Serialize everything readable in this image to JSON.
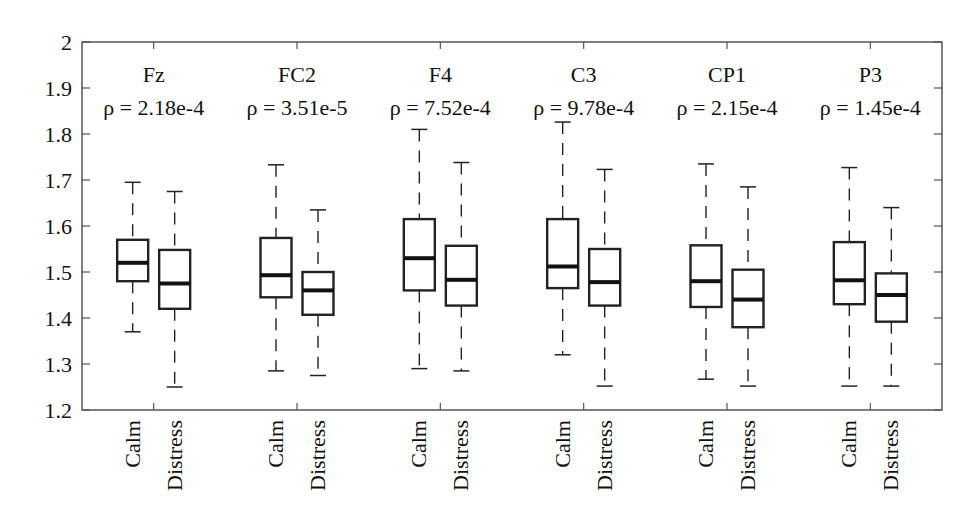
{
  "chart_data": {
    "type": "boxplot",
    "title": "",
    "xlabel": "",
    "ylabel": "",
    "ylim": [
      1.2,
      2.0
    ],
    "yticks": [
      "1.2",
      "1.3",
      "1.4",
      "1.5",
      "1.6",
      "1.7",
      "1.8",
      "1.9",
      "2"
    ],
    "grid": false,
    "legend": null,
    "conditions": [
      "Calm",
      "Distress"
    ],
    "groups": [
      {
        "channel": "Fz",
        "p_label": "ρ = 2.18e-4",
        "boxes": [
          {
            "condition": "Calm",
            "whisker_low": 1.37,
            "q1": 1.48,
            "median": 1.52,
            "q3": 1.57,
            "whisker_high": 1.695
          },
          {
            "condition": "Distress",
            "whisker_low": 1.25,
            "q1": 1.42,
            "median": 1.475,
            "q3": 1.548,
            "whisker_high": 1.675
          }
        ]
      },
      {
        "channel": "FC2",
        "p_label": "ρ = 3.51e-5",
        "boxes": [
          {
            "condition": "Calm",
            "whisker_low": 1.285,
            "q1": 1.445,
            "median": 1.493,
            "q3": 1.574,
            "whisker_high": 1.733
          },
          {
            "condition": "Distress",
            "whisker_low": 1.275,
            "q1": 1.407,
            "median": 1.46,
            "q3": 1.5,
            "whisker_high": 1.635
          }
        ]
      },
      {
        "channel": "F4",
        "p_label": "ρ = 7.52e-4",
        "boxes": [
          {
            "condition": "Calm",
            "whisker_low": 1.29,
            "q1": 1.46,
            "median": 1.53,
            "q3": 1.615,
            "whisker_high": 1.81
          },
          {
            "condition": "Distress",
            "whisker_low": 1.285,
            "q1": 1.427,
            "median": 1.483,
            "q3": 1.557,
            "whisker_high": 1.738
          }
        ]
      },
      {
        "channel": "C3",
        "p_label": "ρ = 9.78e-4",
        "boxes": [
          {
            "condition": "Calm",
            "whisker_low": 1.32,
            "q1": 1.465,
            "median": 1.512,
            "q3": 1.615,
            "whisker_high": 1.826
          },
          {
            "condition": "Distress",
            "whisker_low": 1.252,
            "q1": 1.427,
            "median": 1.478,
            "q3": 1.55,
            "whisker_high": 1.723
          }
        ]
      },
      {
        "channel": "CP1",
        "p_label": "ρ = 2.15e-4",
        "boxes": [
          {
            "condition": "Calm",
            "whisker_low": 1.267,
            "q1": 1.424,
            "median": 1.48,
            "q3": 1.558,
            "whisker_high": 1.735
          },
          {
            "condition": "Distress",
            "whisker_low": 1.252,
            "q1": 1.38,
            "median": 1.44,
            "q3": 1.505,
            "whisker_high": 1.685
          }
        ]
      },
      {
        "channel": "P3",
        "p_label": "ρ = 1.45e-4",
        "boxes": [
          {
            "condition": "Calm",
            "whisker_low": 1.252,
            "q1": 1.43,
            "median": 1.482,
            "q3": 1.565,
            "whisker_high": 1.727
          },
          {
            "condition": "Distress",
            "whisker_low": 1.252,
            "q1": 1.392,
            "median": 1.45,
            "q3": 1.497,
            "whisker_high": 1.64
          }
        ]
      }
    ]
  },
  "colors": {
    "background": "#ffffff",
    "axis": "#555555",
    "box": "#222222",
    "median": "#111111",
    "text": "#111111"
  }
}
